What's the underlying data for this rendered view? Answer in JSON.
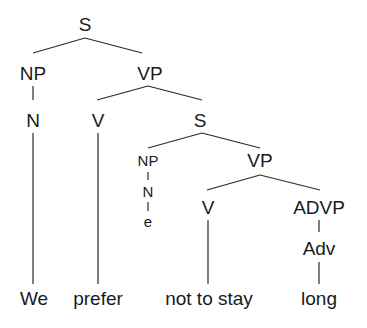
{
  "tree": {
    "root": "S",
    "nodes": [
      {
        "id": "s1",
        "label": "S",
        "x": 85,
        "y": 24,
        "size": "big"
      },
      {
        "id": "np1",
        "label": "NP",
        "x": 33,
        "y": 73,
        "size": "big"
      },
      {
        "id": "vp1",
        "label": "VP",
        "x": 150,
        "y": 73,
        "size": "big"
      },
      {
        "id": "n1",
        "label": "N",
        "x": 33,
        "y": 120,
        "size": "big"
      },
      {
        "id": "v1",
        "label": "V",
        "x": 98,
        "y": 120,
        "size": "big"
      },
      {
        "id": "s2",
        "label": "S",
        "x": 200,
        "y": 120,
        "size": "big"
      },
      {
        "id": "np2",
        "label": "NP",
        "x": 148,
        "y": 160,
        "size": "small"
      },
      {
        "id": "vp2",
        "label": "VP",
        "x": 260,
        "y": 160,
        "size": "big"
      },
      {
        "id": "n2",
        "label": "N",
        "x": 148,
        "y": 191,
        "size": "small"
      },
      {
        "id": "e",
        "label": "e",
        "x": 148,
        "y": 221,
        "size": "small"
      },
      {
        "id": "v2",
        "label": "V",
        "x": 208,
        "y": 207,
        "size": "big"
      },
      {
        "id": "advp",
        "label": "ADVP",
        "x": 319,
        "y": 207,
        "size": "big"
      },
      {
        "id": "adv",
        "label": "Adv",
        "x": 319,
        "y": 248,
        "size": "big"
      }
    ],
    "leaves": [
      {
        "id": "w1",
        "label": "We",
        "x": 34,
        "y": 298
      },
      {
        "id": "w2",
        "label": "prefer",
        "x": 98,
        "y": 298
      },
      {
        "id": "w3",
        "label": "not to stay",
        "x": 209,
        "y": 298
      },
      {
        "id": "w4",
        "label": "long",
        "x": 319,
        "y": 298
      }
    ],
    "edges": [
      [
        85,
        38,
        33,
        53
      ],
      [
        85,
        38,
        142,
        53
      ],
      [
        33,
        86,
        33,
        100
      ],
      [
        148,
        86,
        97,
        100
      ],
      [
        148,
        86,
        202,
        100
      ],
      [
        33,
        133,
        33,
        284
      ],
      [
        98,
        133,
        98,
        284
      ],
      [
        202,
        133,
        148,
        148
      ],
      [
        202,
        133,
        260,
        148
      ],
      [
        148,
        172,
        148,
        180
      ],
      [
        148,
        202,
        148,
        211
      ],
      [
        260,
        175,
        207,
        190
      ],
      [
        260,
        175,
        320,
        190
      ],
      [
        208,
        220,
        208,
        284
      ],
      [
        319,
        220,
        319,
        232
      ],
      [
        319,
        262,
        319,
        284
      ]
    ],
    "line_color": "#2a2a2a"
  }
}
